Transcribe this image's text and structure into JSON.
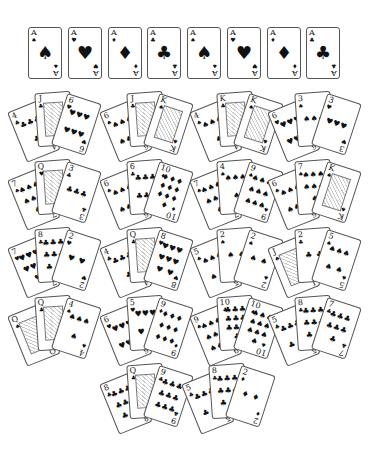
{
  "aces": [
    {
      "rank": "A",
      "suit": "♠",
      "suit_name": "spade"
    },
    {
      "rank": "A",
      "suit": "♥",
      "suit_name": "heart"
    },
    {
      "rank": "A",
      "suit": "♦",
      "suit_name": "diamond"
    },
    {
      "rank": "A",
      "suit": "♣",
      "suit_name": "club"
    },
    {
      "rank": "A",
      "suit": "♠",
      "suit_name": "spade"
    },
    {
      "rank": "A",
      "suit": "♥",
      "suit_name": "heart"
    },
    {
      "rank": "A",
      "suit": "♦",
      "suit_name": "diamond"
    },
    {
      "rank": "A",
      "suit": "♣",
      "suit_name": "club"
    }
  ],
  "hands": [
    {
      "cards": [
        {
          "rank": "4",
          "suit": "♣"
        },
        {
          "rank": "J",
          "suit": "♣"
        },
        {
          "rank": "6",
          "suit": "♥"
        }
      ]
    },
    {
      "cards": [
        {
          "rank": "6",
          "suit": "♠"
        },
        {
          "rank": "J",
          "suit": "♣"
        },
        {
          "rank": "K",
          "suit": "♠"
        }
      ]
    },
    {
      "cards": [
        {
          "rank": "4",
          "suit": "♠"
        },
        {
          "rank": "K",
          "suit": "♣"
        },
        {
          "rank": "K",
          "suit": "♠"
        }
      ]
    },
    {
      "cards": [
        {
          "rank": "6",
          "suit": "♥"
        },
        {
          "rank": "3",
          "suit": "♠"
        },
        {
          "rank": "3",
          "suit": "♥"
        }
      ]
    },
    {
      "cards": [
        {
          "rank": "7",
          "suit": "♠"
        },
        {
          "rank": "Q",
          "suit": "♥"
        },
        {
          "rank": "3",
          "suit": "♣"
        }
      ]
    },
    {
      "cards": [
        {
          "rank": "6",
          "suit": "♠"
        },
        {
          "rank": "6",
          "suit": "♣"
        },
        {
          "rank": "10",
          "suit": "♦"
        }
      ]
    },
    {
      "cards": [
        {
          "rank": "7",
          "suit": "♠"
        },
        {
          "rank": "4",
          "suit": "♠"
        },
        {
          "rank": "9",
          "suit": "♠"
        }
      ]
    },
    {
      "cards": [
        {
          "rank": "6",
          "suit": "♠"
        },
        {
          "rank": "7",
          "suit": "♠"
        },
        {
          "rank": "K",
          "suit": "♠"
        }
      ]
    },
    {
      "cards": [
        {
          "rank": "7",
          "suit": "♥"
        },
        {
          "rank": "8",
          "suit": "♣"
        },
        {
          "rank": "2",
          "suit": "♥"
        }
      ]
    },
    {
      "cards": [
        {
          "rank": "4",
          "suit": "♣"
        },
        {
          "rank": "Q",
          "suit": "♣"
        },
        {
          "rank": "8",
          "suit": "♥"
        }
      ]
    },
    {
      "cards": [
        {
          "rank": "5",
          "suit": "♠"
        },
        {
          "rank": "2",
          "suit": "♠"
        },
        {
          "rank": "2",
          "suit": "♠"
        }
      ]
    },
    {
      "cards": [
        {
          "rank": "J",
          "suit": "♠"
        },
        {
          "rank": "2",
          "suit": "♣"
        },
        {
          "rank": "5",
          "suit": "♠"
        }
      ]
    },
    {
      "cards": [
        {
          "rank": "Q",
          "suit": "♠"
        },
        {
          "rank": "Q",
          "suit": "♣"
        },
        {
          "rank": "4",
          "suit": "♠"
        }
      ]
    },
    {
      "cards": [
        {
          "rank": "6",
          "suit": "♥"
        },
        {
          "rank": "5",
          "suit": "♥"
        },
        {
          "rank": "9",
          "suit": "♦"
        }
      ]
    },
    {
      "cards": [
        {
          "rank": "9",
          "suit": "♠"
        },
        {
          "rank": "10",
          "suit": "♣"
        },
        {
          "rank": "10",
          "suit": "♠"
        }
      ]
    },
    {
      "cards": [
        {
          "rank": "5",
          "suit": "♣"
        },
        {
          "rank": "8",
          "suit": "♣"
        },
        {
          "rank": "7",
          "suit": "♣"
        }
      ]
    },
    {
      "cards": [
        {
          "rank": "8",
          "suit": "♣"
        },
        {
          "rank": "Q",
          "suit": "♣"
        },
        {
          "rank": "9",
          "suit": "♣"
        }
      ]
    },
    {
      "cards": [
        {
          "rank": "5",
          "suit": "♣"
        },
        {
          "rank": "8",
          "suit": "♣"
        },
        {
          "rank": "2",
          "suit": "♦"
        }
      ]
    }
  ]
}
